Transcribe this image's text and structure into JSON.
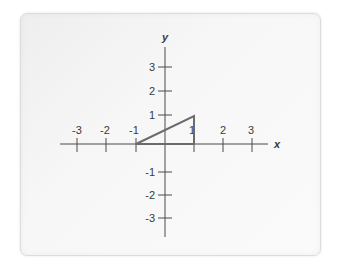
{
  "diagram": {
    "type": "coordinate-plane",
    "x_axis": {
      "label": "x",
      "tick_labels": [
        "-3",
        "-2",
        "-1",
        "1",
        "2",
        "3"
      ],
      "range": [
        -3,
        3
      ]
    },
    "y_axis": {
      "label": "y",
      "tick_labels": [
        "3",
        "2",
        "1",
        "-1",
        "-2",
        "-3"
      ],
      "range": [
        -3,
        3
      ]
    },
    "shape": {
      "kind": "right-triangle",
      "vertices": [
        [
          -1,
          0
        ],
        [
          1,
          0
        ],
        [
          1,
          1
        ]
      ],
      "stroke_color": "#6b6b6b"
    },
    "colors": {
      "axis": "#4a4a4a",
      "card_background": "#f5f5f5",
      "card_border": "#dcdcdc"
    }
  }
}
